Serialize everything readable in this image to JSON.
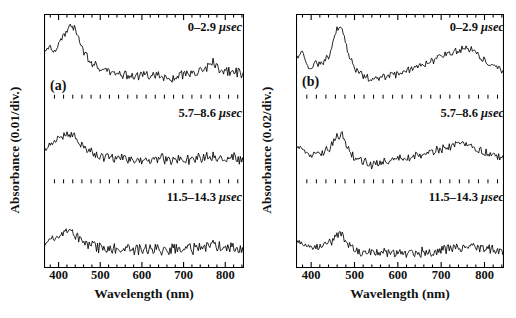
{
  "figure": {
    "kind": "transient-absorption-spectra",
    "panels": [
      {
        "tag": "(a)",
        "ylabel": "Absorbance (0.01/div.)",
        "xlabel": "Wavelength (nm)",
        "xticks": [
          "400",
          "500",
          "600",
          "700",
          "800"
        ],
        "traces": [
          {
            "time_label": "0–2.9",
            "unit": "μsec"
          },
          {
            "time_label": "5.7–8.6",
            "unit": "μsec"
          },
          {
            "time_label": "11.5–14.3",
            "unit": "μsec"
          }
        ]
      },
      {
        "tag": "(b)",
        "ylabel": "Absorbance (0.02/div.)",
        "xlabel": "Wavelength (nm)",
        "xticks": [
          "400",
          "500",
          "600",
          "700",
          "800"
        ],
        "traces": [
          {
            "time_label": "0–2.9",
            "unit": "μsec"
          },
          {
            "time_label": "5.7–8.6",
            "unit": "μsec"
          },
          {
            "time_label": "11.5–14.3",
            "unit": "μsec"
          }
        ]
      }
    ]
  },
  "chart_data": {
    "type": "line",
    "title": "",
    "xlabel": "Wavelength (nm)",
    "xlim": [
      365,
      845
    ],
    "xticks": [
      400,
      500,
      600,
      700,
      800
    ],
    "grid": false,
    "legend": "none",
    "panels": [
      {
        "tag": "(a)",
        "ylabel": "Absorbance (0.01/div.)",
        "y_units_per_div": 0.01,
        "series": [
          {
            "name": "0–2.9 μsec",
            "annotation": "0–2.9 μsec",
            "description": "Strong band peaking near 430 nm, monotonic decay to a weak broad plateau from 550–850 nm with a small rise near 770 nm.",
            "x": [
              370,
              380,
              390,
              400,
              410,
              420,
              430,
              440,
              450,
              460,
              470,
              480,
              490,
              500,
              510,
              520,
              530,
              540,
              550,
              560,
              570,
              580,
              590,
              600,
              610,
              620,
              630,
              640,
              650,
              660,
              670,
              680,
              690,
              700,
              710,
              720,
              730,
              740,
              750,
              760,
              770,
              780,
              790,
              800,
              810,
              820,
              830,
              840
            ],
            "y": [
              0.62,
              0.68,
              0.6,
              0.72,
              0.82,
              0.92,
              1.0,
              0.94,
              0.78,
              0.64,
              0.52,
              0.44,
              0.38,
              0.34,
              0.31,
              0.3,
              0.28,
              0.27,
              0.28,
              0.26,
              0.27,
              0.26,
              0.25,
              0.27,
              0.26,
              0.24,
              0.25,
              0.26,
              0.24,
              0.22,
              0.21,
              0.22,
              0.24,
              0.27,
              0.29,
              0.3,
              0.32,
              0.33,
              0.35,
              0.38,
              0.45,
              0.4,
              0.33,
              0.3,
              0.31,
              0.33,
              0.3,
              0.28
            ],
            "noise_amplitude": 0.06
          },
          {
            "name": "5.7–8.6 μsec",
            "annotation": "5.7–8.6 μsec",
            "description": "Broad band centred near 420–440 nm of reduced amplitude, decaying to a flat noisy baseline beyond 520 nm.",
            "x": [
              370,
              380,
              390,
              400,
              410,
              420,
              430,
              440,
              450,
              460,
              470,
              480,
              490,
              500,
              510,
              520,
              530,
              540,
              550,
              560,
              570,
              580,
              590,
              600,
              610,
              620,
              630,
              640,
              650,
              660,
              670,
              680,
              690,
              700,
              710,
              720,
              730,
              740,
              750,
              760,
              770,
              780,
              790,
              800,
              810,
              820,
              830,
              840
            ],
            "y": [
              0.4,
              0.48,
              0.52,
              0.58,
              0.6,
              0.62,
              0.66,
              0.6,
              0.52,
              0.45,
              0.4,
              0.36,
              0.34,
              0.32,
              0.3,
              0.29,
              0.28,
              0.27,
              0.28,
              0.27,
              0.26,
              0.27,
              0.26,
              0.25,
              0.26,
              0.25,
              0.24,
              0.25,
              0.26,
              0.25,
              0.24,
              0.25,
              0.26,
              0.27,
              0.26,
              0.27,
              0.28,
              0.29,
              0.3,
              0.32,
              0.34,
              0.3,
              0.28,
              0.27,
              0.29,
              0.31,
              0.28,
              0.26
            ],
            "noise_amplitude": 0.07
          },
          {
            "name": "11.5–14.3 μsec",
            "annotation": "11.5–14.3 μsec",
            "description": "Weak residual band near 420 nm on an essentially flat, noise-dominated baseline across the visible and near-IR.",
            "x": [
              370,
              380,
              390,
              400,
              410,
              420,
              430,
              440,
              450,
              460,
              470,
              480,
              490,
              500,
              510,
              520,
              530,
              540,
              550,
              560,
              570,
              580,
              590,
              600,
              610,
              620,
              630,
              640,
              650,
              660,
              670,
              680,
              690,
              700,
              710,
              720,
              730,
              740,
              750,
              760,
              770,
              780,
              790,
              800,
              810,
              820,
              830,
              840
            ],
            "y": [
              0.26,
              0.32,
              0.36,
              0.4,
              0.42,
              0.43,
              0.42,
              0.38,
              0.33,
              0.29,
              0.26,
              0.24,
              0.22,
              0.21,
              0.21,
              0.2,
              0.2,
              0.19,
              0.2,
              0.19,
              0.2,
              0.19,
              0.18,
              0.19,
              0.2,
              0.19,
              0.18,
              0.19,
              0.18,
              0.17,
              0.18,
              0.19,
              0.18,
              0.19,
              0.2,
              0.19,
              0.2,
              0.21,
              0.22,
              0.24,
              0.26,
              0.23,
              0.21,
              0.2,
              0.21,
              0.22,
              0.2,
              0.18
            ],
            "noise_amplitude": 0.07
          }
        ]
      },
      {
        "tag": "(b)",
        "ylabel": "Absorbance (0.02/div.)",
        "y_units_per_div": 0.02,
        "series": [
          {
            "name": "0–2.9 μsec",
            "annotation": "0–2.9 μsec",
            "description": "Sharp intense peak at 465 nm, a shoulder near 385 nm, deep minimum around 540 nm and a broad secondary band maximising near 765 nm.",
            "x": [
              370,
              380,
              390,
              400,
              410,
              420,
              430,
              440,
              450,
              460,
              470,
              480,
              490,
              500,
              510,
              520,
              530,
              540,
              550,
              560,
              570,
              580,
              590,
              600,
              610,
              620,
              630,
              640,
              650,
              660,
              670,
              680,
              690,
              700,
              710,
              720,
              730,
              740,
              750,
              760,
              770,
              780,
              790,
              800,
              810,
              820,
              830,
              840
            ],
            "y": [
              0.52,
              0.6,
              0.4,
              0.36,
              0.44,
              0.42,
              0.46,
              0.52,
              0.7,
              0.95,
              1.0,
              0.72,
              0.5,
              0.38,
              0.3,
              0.25,
              0.22,
              0.2,
              0.21,
              0.23,
              0.24,
              0.26,
              0.27,
              0.28,
              0.3,
              0.32,
              0.34,
              0.36,
              0.39,
              0.42,
              0.45,
              0.48,
              0.5,
              0.53,
              0.56,
              0.58,
              0.6,
              0.62,
              0.64,
              0.66,
              0.63,
              0.58,
              0.52,
              0.46,
              0.42,
              0.4,
              0.38,
              0.34
            ],
            "noise_amplitude": 0.05
          },
          {
            "name": "5.7–8.6 μsec",
            "annotation": "5.7–8.6 μsec",
            "description": "Peak at 465 nm reduced to roughly half the initial intensity; the broad near-IR band near 760 nm persists with comparable relative weight.",
            "x": [
              370,
              380,
              390,
              400,
              410,
              420,
              430,
              440,
              450,
              460,
              470,
              480,
              490,
              500,
              510,
              520,
              530,
              540,
              550,
              560,
              570,
              580,
              590,
              600,
              610,
              620,
              630,
              640,
              650,
              660,
              670,
              680,
              690,
              700,
              710,
              720,
              730,
              740,
              750,
              760,
              770,
              780,
              790,
              800,
              810,
              820,
              830,
              840
            ],
            "y": [
              0.44,
              0.4,
              0.34,
              0.33,
              0.36,
              0.35,
              0.37,
              0.42,
              0.52,
              0.62,
              0.66,
              0.5,
              0.38,
              0.3,
              0.26,
              0.23,
              0.21,
              0.2,
              0.21,
              0.22,
              0.23,
              0.24,
              0.25,
              0.26,
              0.27,
              0.28,
              0.29,
              0.3,
              0.32,
              0.34,
              0.36,
              0.38,
              0.4,
              0.42,
              0.44,
              0.46,
              0.47,
              0.48,
              0.49,
              0.5,
              0.48,
              0.44,
              0.4,
              0.36,
              0.34,
              0.33,
              0.31,
              0.28
            ],
            "noise_amplitude": 0.06
          },
          {
            "name": "11.5–14.3 μsec",
            "annotation": "11.5–14.3 μsec",
            "description": "Residual 465 nm peak at low amplitude; flat low baseline between 500 and 650 nm rising slightly toward a weak 760 nm feature.",
            "x": [
              370,
              380,
              390,
              400,
              410,
              420,
              430,
              440,
              450,
              460,
              470,
              480,
              490,
              500,
              510,
              520,
              530,
              540,
              550,
              560,
              570,
              580,
              590,
              600,
              610,
              620,
              630,
              640,
              650,
              660,
              670,
              680,
              690,
              700,
              710,
              720,
              730,
              740,
              750,
              760,
              770,
              780,
              790,
              800,
              810,
              820,
              830,
              840
            ],
            "y": [
              0.3,
              0.26,
              0.22,
              0.22,
              0.24,
              0.23,
              0.25,
              0.28,
              0.34,
              0.4,
              0.44,
              0.32,
              0.24,
              0.18,
              0.15,
              0.14,
              0.13,
              0.13,
              0.14,
              0.13,
              0.14,
              0.13,
              0.14,
              0.13,
              0.14,
              0.13,
              0.14,
              0.13,
              0.14,
              0.15,
              0.14,
              0.15,
              0.16,
              0.17,
              0.18,
              0.2,
              0.21,
              0.22,
              0.23,
              0.24,
              0.23,
              0.21,
              0.2,
              0.19,
              0.2,
              0.19,
              0.18,
              0.16
            ],
            "noise_amplitude": 0.06
          }
        ]
      }
    ]
  }
}
